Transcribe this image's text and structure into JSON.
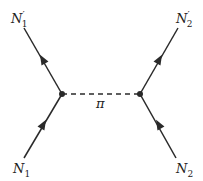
{
  "diagram": {
    "type": "feynman",
    "colors": {
      "line": "#2a2a2a",
      "background": "#ffffff"
    },
    "vertices": [
      {
        "id": "v1",
        "x": 62,
        "y": 94
      },
      {
        "id": "v2",
        "x": 140,
        "y": 94
      }
    ],
    "external": [
      {
        "id": "N1_in",
        "label_base": "N",
        "label_prime": "",
        "label_sub": "1",
        "x": 24,
        "y": 158
      },
      {
        "id": "N1_out",
        "label_base": "N",
        "label_prime": "′",
        "label_sub": "1",
        "x": 24,
        "y": 28
      },
      {
        "id": "N2_in",
        "label_base": "N",
        "label_prime": "",
        "label_sub": "2",
        "x": 176,
        "y": 158
      },
      {
        "id": "N2_out",
        "label_base": "N",
        "label_prime": "′",
        "label_sub": "2",
        "x": 178,
        "y": 28
      }
    ],
    "propagators": [
      {
        "from": "N1_in",
        "to": "v1",
        "style": "solid",
        "arrow": true
      },
      {
        "from": "v1",
        "to": "N1_out",
        "style": "solid",
        "arrow": true
      },
      {
        "from": "N2_in",
        "to": "v2",
        "style": "solid",
        "arrow": true
      },
      {
        "from": "v2",
        "to": "N2_out",
        "style": "solid",
        "arrow": true
      },
      {
        "from": "v1",
        "to": "v2",
        "style": "dashed",
        "arrow": false,
        "label": "π"
      }
    ],
    "labels": {
      "n1_out": {
        "base": "N",
        "prime": "′",
        "sub": "1"
      },
      "n2_out": {
        "base": "N",
        "prime": "′",
        "sub": "2"
      },
      "n1_in": {
        "base": "N",
        "sub": "1"
      },
      "n2_in": {
        "base": "N",
        "sub": "2"
      },
      "pion": "π"
    }
  }
}
